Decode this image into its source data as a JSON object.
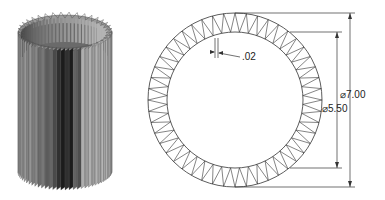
{
  "figure": {
    "left_view": "isometric-corrugated-cylinder",
    "right_view": "top-view-corrugated-ring"
  },
  "dimensions": {
    "outer_diameter": "⌀7.00",
    "inner_diameter": "⌀5.50",
    "thickness": ".02"
  },
  "ring": {
    "teeth_count": 48,
    "center": [
      235,
      100
    ],
    "outer_radius": 87,
    "inner_radius": 68
  },
  "cylinder": {
    "fin_count": 36
  }
}
